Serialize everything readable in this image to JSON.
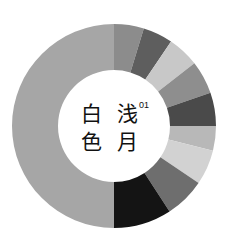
{
  "chart_data": {
    "type": "pie",
    "variant": "donut",
    "center_label": {
      "columns": [
        [
          "白",
          "色"
        ],
        [
          "浅",
          "月"
        ]
      ],
      "index": "01"
    },
    "start_angle_deg": 0,
    "direction": "clockwise",
    "segments": [
      {
        "start": 0,
        "end": 17,
        "color": "#8c8c8c"
      },
      {
        "start": 17,
        "end": 34,
        "color": "#5e5e5e"
      },
      {
        "start": 34,
        "end": 52,
        "color": "#c8c8c8"
      },
      {
        "start": 52,
        "end": 71,
        "color": "#8e8e8e"
      },
      {
        "start": 71,
        "end": 90,
        "color": "#4a4a4a"
      },
      {
        "start": 90,
        "end": 104,
        "color": "#b8b8b8"
      },
      {
        "start": 104,
        "end": 124,
        "color": "#d2d2d2"
      },
      {
        "start": 124,
        "end": 147,
        "color": "#6e6e6e"
      },
      {
        "start": 147,
        "end": 180,
        "color": "#141414"
      },
      {
        "start": 180,
        "end": 360,
        "color": "#a6a6a6"
      }
    ],
    "values": [
      17,
      17,
      18,
      19,
      19,
      14,
      20,
      23,
      33,
      180
    ],
    "geometry": {
      "cx": 114,
      "cy": 126,
      "outer_r": 102,
      "inner_r": 56
    }
  },
  "center": {
    "char_1": "白",
    "char_2": "色",
    "char_3": "浅",
    "char_4": "月",
    "index": "01"
  }
}
